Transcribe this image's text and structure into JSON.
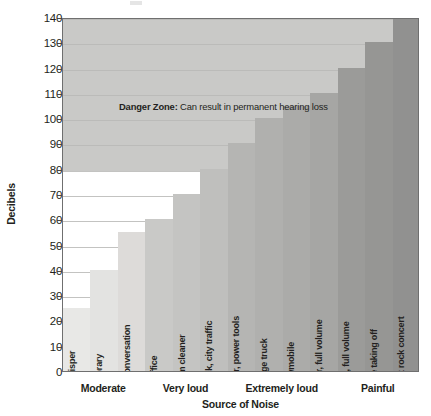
{
  "chart_data": {
    "type": "bar",
    "title": "",
    "xlabel": "Source of Noise",
    "ylabel": "Decibels",
    "ylim": [
      0,
      140
    ],
    "ytick_step": 10,
    "yticks": [
      0,
      10,
      20,
      30,
      40,
      50,
      60,
      70,
      80,
      90,
      100,
      110,
      120,
      130,
      140
    ],
    "grid": true,
    "legend": "none",
    "categories": [
      "whisper",
      "library",
      "normal conversation",
      "office",
      "vacuum cleaner",
      "alarm clock, city traffic",
      "lawn mower, power tools",
      "garbage truck",
      "snowmobile",
      "MP3 player, full volume",
      "car stereo, full volume",
      "jet plane taking off",
      "front row at rock concert"
    ],
    "values": [
      25,
      40,
      55,
      60,
      70,
      80,
      90,
      100,
      105,
      110,
      120,
      130,
      140
    ],
    "bar_colors": [
      "#e8e8e6",
      "#e3e3e1",
      "#dddbd9",
      "#c9c9c7",
      "#c4c4c2",
      "#bfbfbd",
      "#b5b5b3",
      "#b0b0ae",
      "#ababa9",
      "#a6a6a4",
      "#9b9b99",
      "#969694",
      "#919190"
    ],
    "groups": [
      {
        "label": "Moderate",
        "start": 0,
        "count": 3
      },
      {
        "label": "Very loud",
        "start": 3,
        "count": 3
      },
      {
        "label": "Extremely loud",
        "start": 6,
        "count": 4
      },
      {
        "label": "Painful",
        "start": 10,
        "count": 3
      }
    ],
    "annotations": [
      {
        "name": "danger-zone",
        "bold_text": "Danger Zone:",
        "text": " Can result in permanent hearing loss",
        "band_from": 80,
        "band_to": 140,
        "band_color": "#c9c9c7",
        "text_at": 105
      }
    ]
  },
  "colors": {
    "axis": "#6f6f6f",
    "grid": "#b8b8b6",
    "text": "#231f20",
    "danger_band": "#c9c9c7",
    "plot_background": "#ffffff"
  }
}
